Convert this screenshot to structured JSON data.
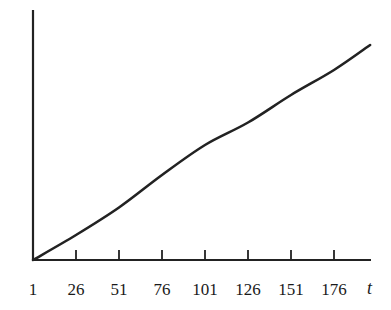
{
  "chart_data": {
    "type": "line",
    "title": "",
    "xlabel": "t",
    "ylabel": "",
    "x_ticks": [
      1,
      26,
      51,
      76,
      101,
      126,
      151,
      176
    ],
    "xlim": [
      1,
      197
    ],
    "ylim": [
      0,
      100
    ],
    "grid": false,
    "legend": null,
    "series": [
      {
        "name": "curve",
        "x": [
          1,
          26,
          51,
          76,
          101,
          126,
          151,
          176,
          197
        ],
        "values": [
          0,
          10,
          21,
          34,
          46,
          55,
          66,
          76,
          86
        ]
      }
    ],
    "colors": {
      "line": "#222222",
      "axis": "#222222"
    }
  }
}
